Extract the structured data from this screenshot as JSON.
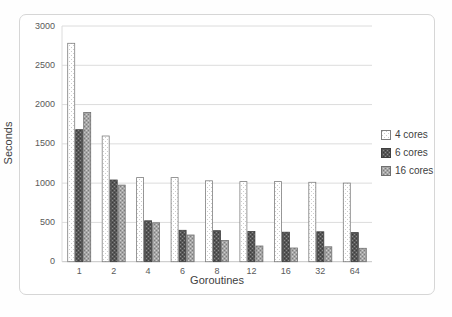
{
  "chart_data": {
    "type": "bar",
    "title": "",
    "xlabel": "Goroutines",
    "ylabel": "Seconds",
    "categories": [
      "1",
      "2",
      "4",
      "6",
      "8",
      "12",
      "16",
      "32",
      "64"
    ],
    "series": [
      {
        "name": "4 cores",
        "values": [
          2780,
          1600,
          1070,
          1070,
          1030,
          1020,
          1020,
          1010,
          1000
        ],
        "fill": "#ffffff",
        "pattern": "dots-light",
        "border": "#7f7f7f"
      },
      {
        "name": "6 cores",
        "values": [
          1680,
          1040,
          520,
          400,
          395,
          385,
          375,
          380,
          370
        ],
        "fill": "#575757",
        "pattern": "checker-dark",
        "border": "#3f3f3f"
      },
      {
        "name": "16 cores",
        "values": [
          1900,
          975,
          495,
          340,
          270,
          200,
          175,
          190,
          170
        ],
        "fill": "#a6a6a6",
        "pattern": "checker-gray",
        "border": "#707070"
      }
    ],
    "ylim": [
      0,
      3000
    ],
    "ytick_step": 500,
    "yticks": [
      "0",
      "500",
      "1000",
      "1500",
      "2000",
      "2500",
      "3000"
    ],
    "grid": true,
    "legend_position": "right",
    "colors": {
      "gridline": "#dcdcdc",
      "baseline": "#c4c4c4",
      "axis_text": "#595959",
      "axis_title": "#404040",
      "frame_border": "#d6d6d6"
    }
  }
}
